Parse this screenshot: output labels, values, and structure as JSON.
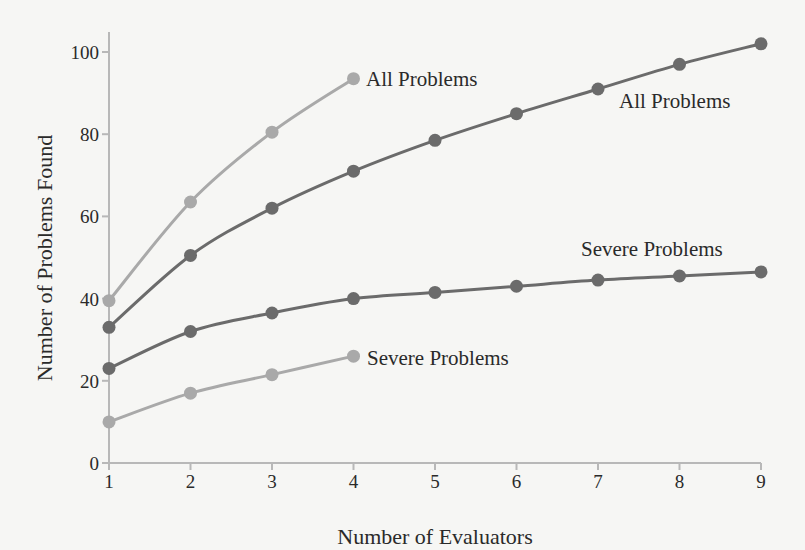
{
  "chart_data": {
    "type": "line",
    "title": "",
    "xlabel": "Number of Evaluators",
    "ylabel": "Number of Problems Found",
    "x": [
      1,
      2,
      3,
      4,
      5,
      6,
      7,
      8,
      9
    ],
    "xlim": [
      1,
      9
    ],
    "ylim": [
      0,
      100
    ],
    "xticks": [
      1,
      2,
      3,
      4,
      5,
      6,
      7,
      8,
      9
    ],
    "yticks": [
      0,
      20,
      40,
      60,
      80,
      100
    ],
    "grid": false,
    "legend": "inline labels at series",
    "series": [
      {
        "name": "All Problems",
        "shade": "light",
        "color": "#a9a9a9",
        "x": [
          1,
          2,
          3,
          4
        ],
        "values": [
          39.5,
          63.5,
          80.5,
          93.5
        ],
        "label_pos": "right of last point"
      },
      {
        "name": "All Problems",
        "shade": "dark",
        "color": "#6b6b6b",
        "x": [
          1,
          2,
          3,
          4,
          5,
          6,
          7,
          8,
          9
        ],
        "values": [
          33,
          50.5,
          62,
          71,
          78.5,
          85,
          91,
          97,
          102
        ],
        "label_pos": "below line near x=8"
      },
      {
        "name": "Severe Problems",
        "shade": "dark",
        "color": "#6b6b6b",
        "x": [
          1,
          2,
          3,
          4,
          5,
          6,
          7,
          8,
          9
        ],
        "values": [
          23,
          32,
          36.5,
          40,
          41.5,
          43,
          44.5,
          45.5,
          46.5
        ],
        "label_pos": "above line near x=8"
      },
      {
        "name": "Severe Problems",
        "shade": "light",
        "color": "#a9a9a9",
        "x": [
          1,
          2,
          3,
          4
        ],
        "values": [
          10,
          17,
          21.5,
          26
        ],
        "label_pos": "right of last point"
      }
    ]
  },
  "plot_area": {
    "x0_px": 109,
    "x1_px": 761,
    "y0_px": 463,
    "y100_px": 52,
    "axis_top_px": 32
  },
  "labels": [
    {
      "text": "All Problems",
      "x_px": 366,
      "y_px": 86
    },
    {
      "text": "All Problems",
      "x_px": 619,
      "y_px": 108
    },
    {
      "text": "Severe Problems",
      "x_px": 581,
      "y_px": 256
    },
    {
      "text": "Severe Problems",
      "x_px": 367,
      "y_px": 365
    }
  ]
}
